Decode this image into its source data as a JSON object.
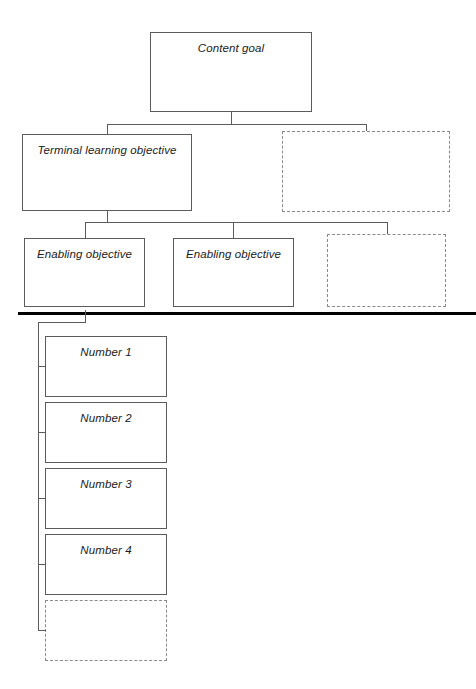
{
  "diagram": {
    "style": {
      "solid_border_color": "#5b5b5b",
      "dashed_border_color": "#8a8a8a",
      "connector_color": "#5b5b5b",
      "divider_color": "#000000",
      "background": "#ffffff",
      "text_color": "#1b1b1b"
    },
    "levels": {
      "level1": {
        "nodes": [
          {
            "id": "content-goal",
            "label": "Content goal",
            "variant": "solid",
            "x": 150,
            "y": 32,
            "w": 162,
            "h": 80
          }
        ]
      },
      "level2": {
        "nodes": [
          {
            "id": "terminal-learning-objective",
            "label": "Terminal learning objective",
            "variant": "solid",
            "x": 22,
            "y": 134,
            "w": 170,
            "h": 77
          },
          {
            "id": "level2-placeholder",
            "label": "",
            "variant": "dashed",
            "x": 282,
            "y": 131,
            "w": 168,
            "h": 81
          }
        ]
      },
      "level3": {
        "nodes": [
          {
            "id": "enabling-objective-1",
            "label": "Enabling objective",
            "variant": "solid",
            "x": 24,
            "y": 238,
            "w": 121,
            "h": 69
          },
          {
            "id": "enabling-objective-2",
            "label": "Enabling objective",
            "variant": "solid",
            "x": 173,
            "y": 238,
            "w": 121,
            "h": 69
          },
          {
            "id": "level3-placeholder",
            "label": "",
            "variant": "dashed",
            "x": 327,
            "y": 234,
            "w": 119,
            "h": 73
          }
        ]
      },
      "level4": {
        "nodes": [
          {
            "id": "number-1",
            "label": "Number 1",
            "variant": "solid",
            "x": 45,
            "y": 336,
            "w": 122,
            "h": 61
          },
          {
            "id": "number-2",
            "label": "Number 2",
            "variant": "solid",
            "x": 45,
            "y": 402,
            "w": 122,
            "h": 61
          },
          {
            "id": "number-3",
            "label": "Number 3",
            "variant": "solid",
            "x": 45,
            "y": 468,
            "w": 122,
            "h": 61
          },
          {
            "id": "number-4",
            "label": "Number 4",
            "variant": "solid",
            "x": 45,
            "y": 534,
            "w": 122,
            "h": 61
          },
          {
            "id": "level4-placeholder",
            "label": "",
            "variant": "dashed",
            "x": 45,
            "y": 600,
            "w": 122,
            "h": 61
          }
        ]
      }
    },
    "divider": {
      "id": "section-divider",
      "x": 18,
      "y": 312,
      "w": 458,
      "h": 3
    },
    "connectors": [
      {
        "id": "goal-stem-down",
        "type": "v",
        "x": 231,
        "y": 112,
        "len": 12
      },
      {
        "id": "level2-bus",
        "type": "h",
        "x": 107,
        "y": 124,
        "len": 259
      },
      {
        "id": "terminal-riser",
        "type": "v",
        "x": 107,
        "y": 124,
        "len": 10
      },
      {
        "id": "level2-placeholder-riser",
        "type": "v",
        "x": 366,
        "y": 124,
        "len": 7
      },
      {
        "id": "terminal-stem-down",
        "type": "v",
        "x": 107,
        "y": 211,
        "len": 11
      },
      {
        "id": "level3-bus",
        "type": "h",
        "x": 85,
        "y": 222,
        "len": 302
      },
      {
        "id": "enabling-1-riser",
        "type": "v",
        "x": 85,
        "y": 222,
        "len": 16
      },
      {
        "id": "enabling-2-riser",
        "type": "v",
        "x": 233,
        "y": 222,
        "len": 16
      },
      {
        "id": "level3-placeholder-riser",
        "type": "v",
        "x": 387,
        "y": 222,
        "len": 12
      },
      {
        "id": "spine-top-link",
        "type": "h",
        "x": 38,
        "y": 322,
        "len": 48
      },
      {
        "id": "spine-top-riser",
        "type": "v",
        "x": 85,
        "y": 310,
        "len": 12
      },
      {
        "id": "list-spine",
        "type": "v",
        "x": 38,
        "y": 322,
        "len": 309
      },
      {
        "id": "stub-number-1",
        "type": "h",
        "x": 38,
        "y": 366,
        "len": 8
      },
      {
        "id": "stub-number-2",
        "type": "h",
        "x": 38,
        "y": 432,
        "len": 8
      },
      {
        "id": "stub-number-3",
        "type": "h",
        "x": 38,
        "y": 498,
        "len": 8
      },
      {
        "id": "stub-number-4",
        "type": "h",
        "x": 38,
        "y": 564,
        "len": 8
      },
      {
        "id": "stub-placeholder",
        "type": "h",
        "x": 38,
        "y": 630,
        "len": 8
      }
    ]
  }
}
